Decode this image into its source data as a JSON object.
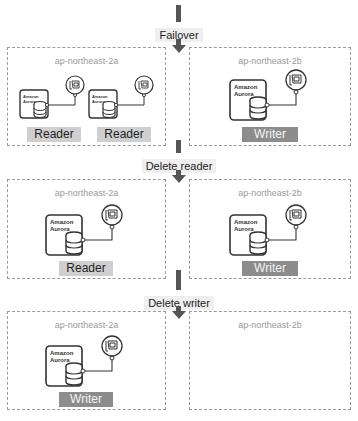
{
  "steps": [
    {
      "label": "Failover"
    },
    {
      "label": "Delete reader"
    },
    {
      "label": "Delete writer"
    }
  ],
  "stages": [
    {
      "zones": [
        {
          "name": "ap-northeast-2a",
          "instances": [
            {
              "product": [
                "Amazon",
                "Aurora"
              ],
              "role": "Reader"
            },
            {
              "product": [
                "Amazon",
                "Aurora"
              ],
              "role": "Reader"
            }
          ]
        },
        {
          "name": "ap-northeast-2b",
          "instances": [
            {
              "product": [
                "Amazon",
                "Aurora"
              ],
              "role": "Writer"
            }
          ]
        }
      ]
    },
    {
      "zones": [
        {
          "name": "ap-northeast-2a",
          "instances": [
            {
              "product": [
                "Amazon",
                "Aurora"
              ],
              "role": "Reader"
            }
          ]
        },
        {
          "name": "ap-northeast-2b",
          "instances": [
            {
              "product": [
                "Amazon",
                "Aurora"
              ],
              "role": "Writer"
            }
          ]
        }
      ]
    },
    {
      "zones": [
        {
          "name": "ap-northeast-2a",
          "instances": [
            {
              "product": [
                "Amazon",
                "Aurora"
              ],
              "role": "Writer"
            }
          ]
        },
        {
          "name": "ap-northeast-2b",
          "instances": []
        }
      ]
    }
  ],
  "icons": {
    "instance": "aurora-instance-icon",
    "database": "database-cylinder-icon",
    "endpoint": "network-interface-icon",
    "arrow": "down-arrow-icon"
  },
  "colors": {
    "reader_bg": "#cfcfcf",
    "writer_bg": "#8c8c8c",
    "arrow": "#555555",
    "zone_border": "#9a9a9a"
  }
}
